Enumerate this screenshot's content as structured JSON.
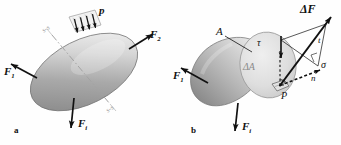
{
  "figure": {
    "type": "engineering-mechanics-diagram",
    "background_color": "#ffffff",
    "ink_color": "#111111",
    "body_fill_light": "#e9e9e9",
    "body_fill_dark": "#8e8e8e",
    "cut_face_fill": "#dcdcdc",
    "ghost_color": "#9a9a9a"
  },
  "panels": [
    {
      "key": "a",
      "label": "a",
      "caption": "Body in equilibrium under external loads with an imaginary cutting plane",
      "forces": [
        {
          "name": "F1",
          "base": "F",
          "subscript": "1",
          "label": "F₁",
          "direction": "up-left"
        },
        {
          "name": "F2",
          "base": "F",
          "subscript": "2",
          "label": "F₂",
          "direction": "up-right"
        },
        {
          "name": "Fi",
          "base": "F",
          "subscript": "i",
          "label": "Fᵢ",
          "direction": "down"
        }
      ],
      "distributed_load": {
        "name": "p",
        "label": "p",
        "arrow_count": 4,
        "direction": "down-into-surface"
      },
      "section_line": {
        "style": "dash-dot",
        "near_label": "s-s",
        "far_label": "s-s"
      }
    },
    {
      "key": "b",
      "label": "b",
      "caption": "Cut body showing internal force increment on elemental area",
      "forces": [
        {
          "name": "F1",
          "base": "F",
          "subscript": "1",
          "label": "F₁",
          "direction": "up-left"
        },
        {
          "name": "Fi",
          "base": "F",
          "subscript": "i",
          "label": "Fᵢ",
          "direction": "down"
        }
      ],
      "annotations": [
        {
          "name": "section-area",
          "label": "A",
          "italic": true,
          "bold": false,
          "role": "total cut cross-section area"
        },
        {
          "name": "element-area",
          "label": "ΔA",
          "italic": true,
          "bold": false,
          "role": "elemental area on the cut face"
        },
        {
          "name": "point",
          "label": "P",
          "italic": true,
          "bold": false,
          "role": "point at centre of element"
        },
        {
          "name": "force-increment",
          "label": "ΔF",
          "italic": true,
          "bold": true,
          "role": "resultant internal force on element"
        },
        {
          "name": "normal-stress",
          "label": "σ",
          "italic": true,
          "bold": false,
          "role": "normal component of stress"
        },
        {
          "name": "shear-stress",
          "label": "τ",
          "italic": true,
          "bold": false,
          "role": "tangential (shear) component"
        },
        {
          "name": "normal-axis",
          "label": "n",
          "italic": true,
          "bold": false,
          "role": "outward normal to the section"
        },
        {
          "name": "tangential-axis",
          "label": "t",
          "italic": true,
          "bold": false,
          "role": "in-plane direction of shear component"
        }
      ]
    }
  ]
}
